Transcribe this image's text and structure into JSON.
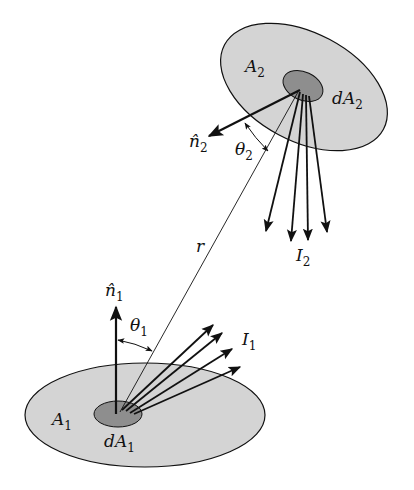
{
  "diagram": {
    "colors": {
      "large_area": "#d4d4d4",
      "small_area": "#8e8e8e",
      "stroke": "#111111",
      "background": "#ffffff"
    },
    "labels": {
      "A1": {
        "base": "A",
        "sub": "1"
      },
      "dA1": {
        "base": "dA",
        "sub": "1"
      },
      "A2": {
        "base": "A",
        "sub": "2"
      },
      "dA2": {
        "base": "dA",
        "sub": "2"
      },
      "n1": {
        "base": "n̂",
        "sub": "1"
      },
      "n2": {
        "base": "n̂",
        "sub": "2"
      },
      "theta1": {
        "base": "θ",
        "sub": "1"
      },
      "theta2": {
        "base": "θ",
        "sub": "2"
      },
      "I1": {
        "base": "I",
        "sub": "1"
      },
      "I2": {
        "base": "I",
        "sub": "2"
      },
      "r": "r"
    }
  }
}
